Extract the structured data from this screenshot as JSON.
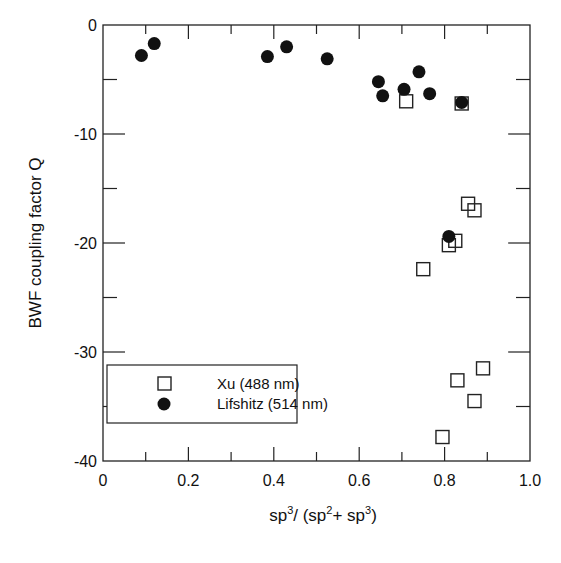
{
  "chart_data": {
    "type": "scatter",
    "title": "",
    "xlabel": "sp3/ (sp2+ sp3)",
    "xlabel_parts": {
      "a": "sp",
      "a_sup": "3",
      "b": "/ (sp",
      "b_sup": "2",
      "c": "+ sp",
      "c_sup": "3",
      "d": ")"
    },
    "ylabel": "BWF coupling factor Q",
    "xlim": [
      0,
      1.0
    ],
    "ylim": [
      -40,
      0
    ],
    "x_ticks": [
      "0",
      "0.2",
      "0.4",
      "0.6",
      "0.8",
      "1.0"
    ],
    "y_ticks": [
      "0",
      "-10",
      "-20",
      "-30",
      "-40"
    ],
    "grid": false,
    "legend_position": "lower-left",
    "series": [
      {
        "name": "Xu (488 nm)",
        "marker": "open-square",
        "points": [
          {
            "x": 0.71,
            "y": -7.0
          },
          {
            "x": 0.84,
            "y": -7.2
          },
          {
            "x": 0.75,
            "y": -22.4
          },
          {
            "x": 0.81,
            "y": -20.2
          },
          {
            "x": 0.825,
            "y": -19.8
          },
          {
            "x": 0.855,
            "y": -16.4
          },
          {
            "x": 0.87,
            "y": -17.0
          },
          {
            "x": 0.83,
            "y": -32.6
          },
          {
            "x": 0.89,
            "y": -31.5
          },
          {
            "x": 0.87,
            "y": -34.5
          },
          {
            "x": 0.795,
            "y": -37.8
          }
        ]
      },
      {
        "name": "Lifshitz (514 nm)",
        "marker": "filled-circle",
        "points": [
          {
            "x": 0.09,
            "y": -2.8
          },
          {
            "x": 0.12,
            "y": -1.7
          },
          {
            "x": 0.385,
            "y": -2.9
          },
          {
            "x": 0.43,
            "y": -2.0
          },
          {
            "x": 0.525,
            "y": -3.1
          },
          {
            "x": 0.645,
            "y": -5.2
          },
          {
            "x": 0.655,
            "y": -6.5
          },
          {
            "x": 0.705,
            "y": -5.9
          },
          {
            "x": 0.74,
            "y": -4.3
          },
          {
            "x": 0.765,
            "y": -6.3
          },
          {
            "x": 0.84,
            "y": -7.1
          },
          {
            "x": 0.81,
            "y": -19.4
          }
        ]
      }
    ]
  },
  "legend": {
    "items": [
      {
        "label": "Xu (488 nm)"
      },
      {
        "label": "Lifshitz (514 nm)"
      }
    ]
  }
}
